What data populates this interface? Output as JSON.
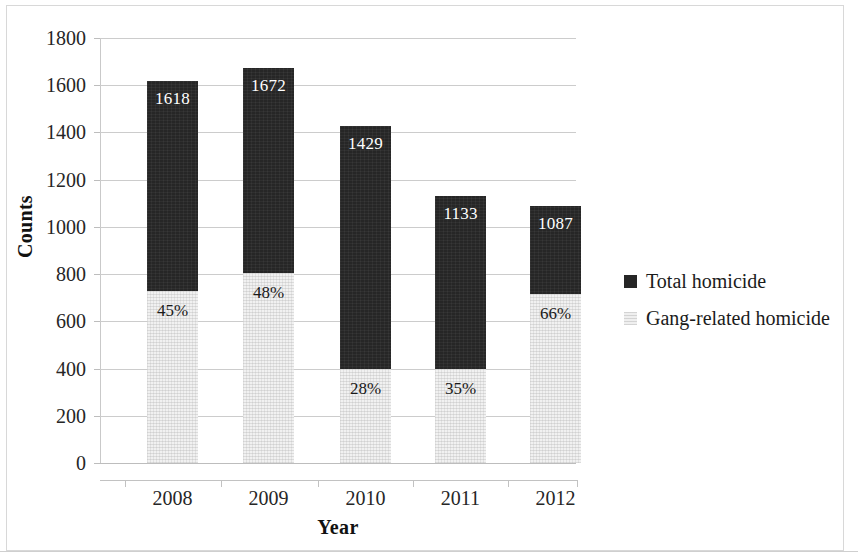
{
  "chart_data": {
    "type": "bar",
    "title": "",
    "subtitle": "",
    "xlabel": "Year",
    "ylabel": "Counts",
    "categories": [
      "2008",
      "2009",
      "2010",
      "2011",
      "2012"
    ],
    "ylim": [
      0,
      1800
    ],
    "yticks": [
      0,
      200,
      400,
      600,
      800,
      1000,
      1200,
      1400,
      1600,
      1800
    ],
    "ytick_labels": [
      "0",
      "200",
      "400",
      "600",
      "800",
      "1000",
      "1200",
      "1400",
      "1600",
      "1800"
    ],
    "grid": true,
    "legend_position": "right",
    "series": [
      {
        "name": "Total homicide",
        "color": "#262626",
        "values": [
          1618,
          1672,
          1429,
          1133,
          1087
        ],
        "data_labels": [
          "1618",
          "1672",
          "1429",
          "1133",
          "1087"
        ]
      },
      {
        "name": "Gang-related homicide",
        "color": "#f1f1f1",
        "values": [
          728,
          803,
          400,
          397,
          717
        ],
        "percent_of_total": [
          45,
          48,
          28,
          35,
          66
        ],
        "data_labels": [
          "45%",
          "48%",
          "28%",
          "35%",
          "66%"
        ]
      }
    ],
    "legend": [
      {
        "label": "Total homicide",
        "color": "#262626",
        "swatch": "square-dark"
      },
      {
        "label": "Gang-related homicide",
        "color": "#f1f1f1",
        "swatch": "square-light"
      }
    ]
  }
}
